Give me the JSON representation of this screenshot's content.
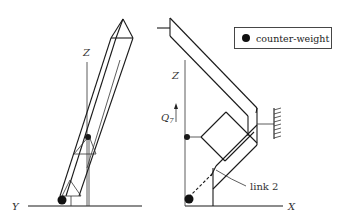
{
  "figure": {
    "type": "robot-arm-counterweight-diagram",
    "left_view": {
      "axis_labels": {
        "vertical": "Z",
        "horizontal": "Y"
      }
    },
    "right_view": {
      "axis_labels": {
        "vertical": "Z",
        "horizontal": "X"
      },
      "joint_label": "Q",
      "joint_subscript": "7",
      "annotation": "link 2"
    },
    "legend": {
      "symbol": "filled-circle",
      "label": "counter-weight"
    },
    "colors": {
      "ink": "#1a1a1a",
      "background": "#ffffff"
    }
  }
}
